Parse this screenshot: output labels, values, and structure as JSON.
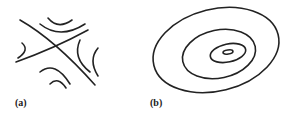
{
  "figure": {
    "panels": [
      {
        "id": "a",
        "label": "(a)",
        "description": "Saddle-point contour lines (hyperbolic level sets with crossing asymptotes)"
      },
      {
        "id": "b",
        "label": "(b)",
        "description": "Nested elliptical contour lines around a minimum"
      }
    ],
    "stroke_color": "#222222"
  }
}
